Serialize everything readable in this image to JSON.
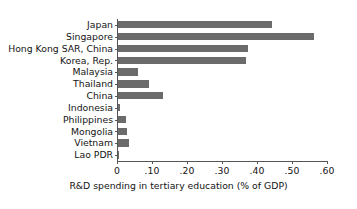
{
  "chart_data": {
    "type": "bar",
    "orientation": "horizontal",
    "title": "",
    "xlabel": "R&D spending in tertiary education (% of GDP)",
    "ylabel": "",
    "xlim": [
      0,
      0.6
    ],
    "xticks": [
      0,
      0.1,
      0.2,
      0.3,
      0.4,
      0.5,
      0.6
    ],
    "xtick_labels": [
      "0",
      ".10",
      ".20",
      ".30",
      ".40",
      ".50",
      ".60"
    ],
    "grid": false,
    "legend": null,
    "bar_color": "#6b6b6b",
    "axis_color": "#555555",
    "background_color": "#ffffff",
    "categories": [
      "Japan",
      "Singapore",
      "Hong Kong SAR, China",
      "Korea, Rep.",
      "Malaysia",
      "Thailand",
      "China",
      "Indonesia",
      "Philippines",
      "Mongolia",
      "Vietnam",
      "Lao PDR"
    ],
    "values": [
      0.44,
      0.56,
      0.37,
      0.365,
      0.057,
      0.089,
      0.128,
      0.005,
      0.022,
      0.026,
      0.031,
      0.002
    ]
  }
}
